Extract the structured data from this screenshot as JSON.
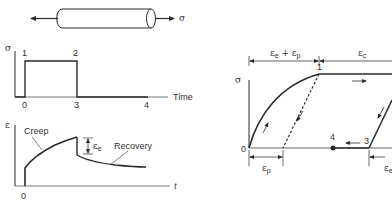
{
  "specimen": {
    "stress_label": "σ"
  },
  "stress_plot": {
    "y_label": "σ",
    "x_label": "Time",
    "point_labels": [
      "1",
      "2"
    ],
    "x_ticks": [
      "0",
      "3",
      "4"
    ]
  },
  "strain_plot": {
    "y_label": "ε",
    "x_label": "t",
    "x_tick": "0",
    "creep_label": "Creep",
    "recovery_label": "Recovery",
    "elastic_label": "ε",
    "elastic_sub": "e"
  },
  "stress_strain_plot": {
    "y_label": "σ",
    "origin_label": "0",
    "point_labels": {
      "p1": "1",
      "p3": "3",
      "p4": "4"
    },
    "top_dim_left": {
      "main": "ε",
      "sub1": "e",
      "plus": " + ",
      "main2": "ε",
      "sub2": "p"
    },
    "top_dim_right": {
      "main": "ε",
      "sub": "c"
    },
    "bottom_dim_left": {
      "main": "ε",
      "sub": "p"
    },
    "bottom_dim_right": {
      "main": "ε",
      "sub": "e"
    }
  },
  "colors": {
    "line": "#2a2a2a",
    "text": "#333333",
    "background": "#ffffff"
  }
}
